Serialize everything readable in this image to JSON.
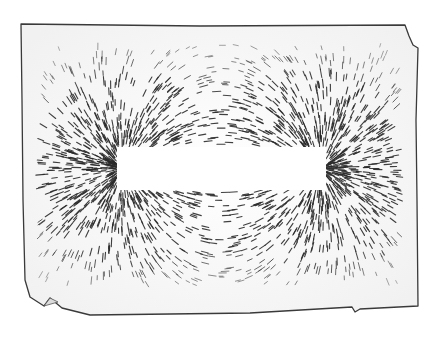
{
  "image": {
    "subject": "iron filings around a bar magnet",
    "colors": {
      "paper": "#fafafa",
      "border": "#3a3a3a",
      "filings": "#2a2a2a",
      "magnet": "#ffffff"
    },
    "magnet": {
      "x": 117,
      "y": 147,
      "width": 209,
      "height": 43
    }
  }
}
